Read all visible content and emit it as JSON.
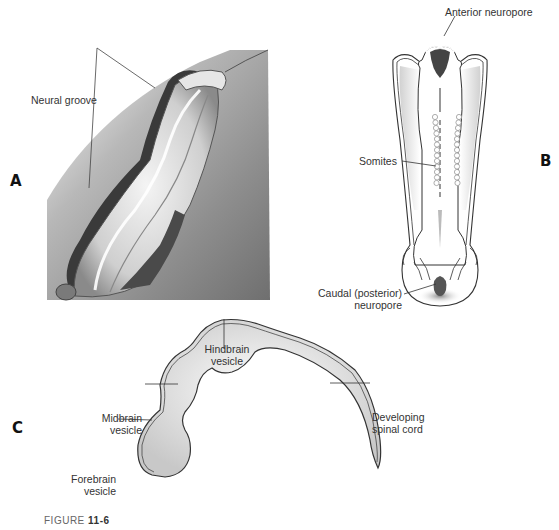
{
  "panels": {
    "a": {
      "letter": "A",
      "labels": {
        "neural_groove": "Neural groove"
      }
    },
    "b": {
      "letter": "B",
      "labels": {
        "anterior_neuropore": "Anterior neuropore",
        "somites": "Somites",
        "caudal_neuropore_line1": "Caudal (posterior)",
        "caudal_neuropore_line2": "neuropore"
      }
    },
    "c": {
      "letter": "C",
      "labels": {
        "hindbrain_line1": "Hindbrain",
        "hindbrain_line2": "vesicle",
        "midbrain_line1": "Midbrain",
        "midbrain_line2": "vesicle",
        "forebrain_line1": "Forebrain",
        "forebrain_line2": "vesicle",
        "spinal_line1": "Developing",
        "spinal_line2": "spinal cord"
      }
    }
  },
  "caption": {
    "prefix": "FIGURE",
    "number": "11-6"
  },
  "colors": {
    "line": "#333333",
    "shade": "#9a9a9a",
    "dark": "#444444"
  }
}
